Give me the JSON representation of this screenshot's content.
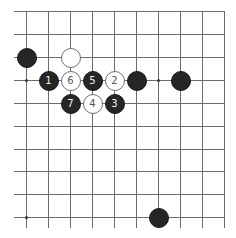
{
  "diagram": {
    "type": "go-board-fragment",
    "edges_visible": [
      "top",
      "right"
    ],
    "grid": {
      "columns": 10,
      "rows": 10,
      "x_positions": [
        26,
        48,
        70,
        92,
        114,
        136,
        158,
        180,
        202,
        224
      ],
      "y_positions": [
        11,
        34,
        57,
        80,
        103,
        126,
        149,
        171,
        194,
        217
      ],
      "line_color": "#6b6b6b"
    },
    "star_points": [
      {
        "col": 0,
        "row": 3
      },
      {
        "col": 6,
        "row": 3
      },
      {
        "col": 0,
        "row": 9
      }
    ],
    "stones": [
      {
        "color": "black",
        "col": 0,
        "row": 2,
        "label": ""
      },
      {
        "color": "white",
        "col": 2,
        "row": 2,
        "label": ""
      },
      {
        "color": "black",
        "col": 1,
        "row": 3,
        "label": "1"
      },
      {
        "color": "white",
        "col": 2,
        "row": 3,
        "label": "6"
      },
      {
        "color": "black",
        "col": 3,
        "row": 3,
        "label": "5"
      },
      {
        "color": "white",
        "col": 4,
        "row": 3,
        "label": "2"
      },
      {
        "color": "black",
        "col": 5,
        "row": 3,
        "label": ""
      },
      {
        "color": "black",
        "col": 7,
        "row": 3,
        "label": ""
      },
      {
        "color": "black",
        "col": 2,
        "row": 4,
        "label": "7"
      },
      {
        "color": "white",
        "col": 3,
        "row": 4,
        "label": "4"
      },
      {
        "color": "black",
        "col": 4,
        "row": 4,
        "label": "3"
      },
      {
        "color": "black",
        "col": 6,
        "row": 9,
        "label": ""
      }
    ],
    "colors": {
      "black_stone": "#262626",
      "white_stone": "#ffffff",
      "white_stone_border": "#707070",
      "black_label": "#f2f2f2",
      "white_label": "#555555"
    }
  }
}
